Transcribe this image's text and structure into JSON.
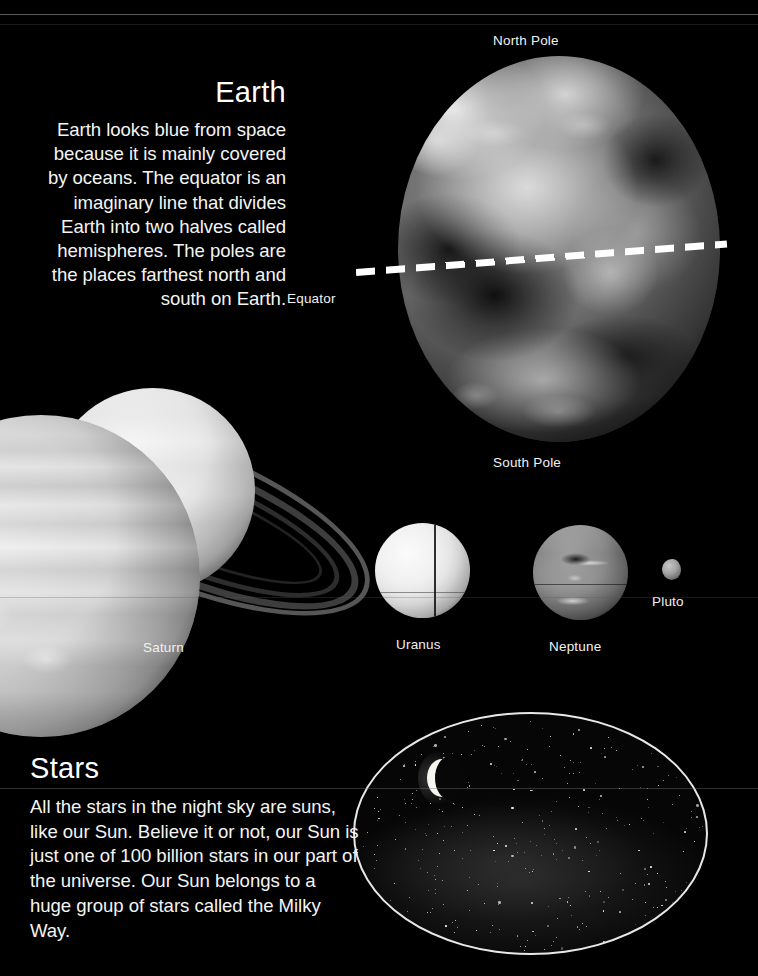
{
  "page": {
    "background_color": "#000000",
    "text_color": "#f4f4f4",
    "accent_color": "#ffffff"
  },
  "earth_section": {
    "heading": "Earth",
    "body": "Earth looks blue from space because it is mainly covered by oceans. The equator is an imaginary line that divides Earth into two halves called hemispheres. The poles are the places farthest north and south on Earth."
  },
  "earth_diagram": {
    "labels": {
      "north_pole": "North Pole",
      "south_pole": "South Pole",
      "equator": "Equator"
    },
    "equator_line_style": "white dashed"
  },
  "planets": [
    {
      "name": "Saturn",
      "label": "Saturn"
    },
    {
      "name": "Uranus",
      "label": "Uranus"
    },
    {
      "name": "Neptune",
      "label": "Neptune"
    },
    {
      "name": "Pluto",
      "label": "Pluto"
    }
  ],
  "stars_section": {
    "heading": "Stars",
    "body": "All the stars in the night sky are suns, like our Sun. Believe it or not, our Sun is just one of 100 billion stars in our part of the universe. Our Sun belongs to a huge group of stars called the Milky Way."
  },
  "milky_way": {
    "outline_color": "#e8e8e8",
    "contains": "starfield-with-crescent-moon"
  }
}
